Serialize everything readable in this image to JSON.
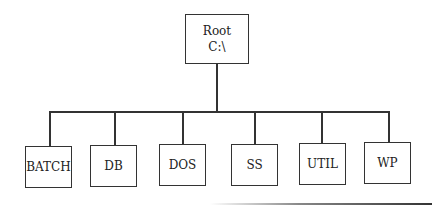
{
  "diagram": {
    "type": "tree",
    "root": {
      "line1": "Root",
      "line2": "C:\\"
    },
    "children": [
      {
        "label": "BATCH"
      },
      {
        "label": "DB"
      },
      {
        "label": "DOS"
      },
      {
        "label": "SS"
      },
      {
        "label": "UTIL"
      },
      {
        "label": "WP"
      }
    ]
  }
}
